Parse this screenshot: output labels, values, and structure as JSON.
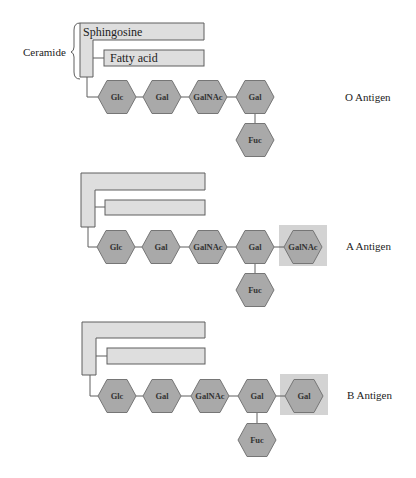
{
  "ceramide_label": "Ceramide",
  "lipids": {
    "sphingosine": "Sphingosine",
    "fatty_acid": "Fatty acid"
  },
  "colors": {
    "residue_fill": "#a9a9a9",
    "residue_stroke": "#767676",
    "lipid_fill": "#dedede",
    "terminal_highlight": "#d3d3d3"
  },
  "antigens": [
    {
      "name": "O Antigen",
      "chain": [
        "Glc",
        "Gal",
        "GalNAc",
        "Gal"
      ],
      "branch": "Fuc",
      "terminal": null
    },
    {
      "name": "A Antigen",
      "chain": [
        "Glc",
        "Gal",
        "GalNAc",
        "Gal"
      ],
      "branch": "Fuc",
      "terminal": "GalNAc"
    },
    {
      "name": "B Antigen",
      "chain": [
        "Glc",
        "Gal",
        "GalNAc",
        "Gal"
      ],
      "branch": "Fuc",
      "terminal": "Gal"
    }
  ]
}
